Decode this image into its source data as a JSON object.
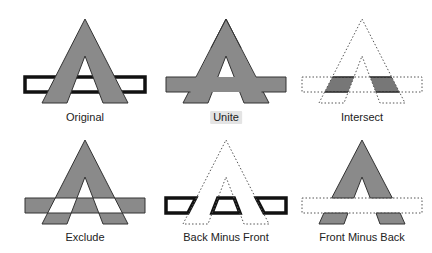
{
  "colors": {
    "fill": "#8a8a8a",
    "stroke": "#222222",
    "dotted": "#555555",
    "label_highlight": "#e4e4e4"
  },
  "panels": [
    {
      "id": "original",
      "label": "Original",
      "row": 0,
      "col": 0,
      "highlighted": false
    },
    {
      "id": "unite",
      "label": "Unite",
      "row": 0,
      "col": 1,
      "highlighted": true
    },
    {
      "id": "intersect",
      "label": "Intersect",
      "row": 0,
      "col": 2,
      "highlighted": false
    },
    {
      "id": "exclude",
      "label": "Exclude",
      "row": 1,
      "col": 0,
      "highlighted": false
    },
    {
      "id": "back-minus-front",
      "label": "Back Minus Front",
      "row": 1,
      "col": 1,
      "highlighted": false
    },
    {
      "id": "front-minus-back",
      "label": "Front Minus Back",
      "row": 1,
      "col": 2,
      "highlighted": false
    }
  ]
}
